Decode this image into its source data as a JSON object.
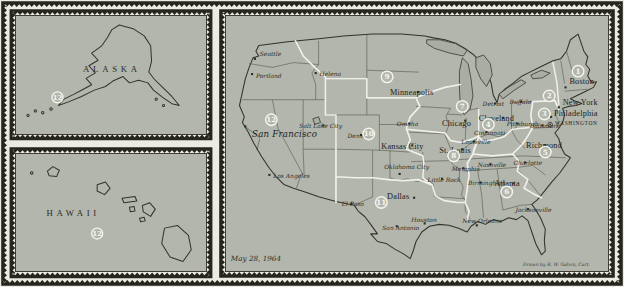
{
  "figure": {
    "date_label": "May 28, 1964",
    "credit": "Drawn by R. W. Galvin, Cart."
  },
  "colors": {
    "paper": "#ebebe3",
    "map_background": "#b2b6ac",
    "ink": "#2e2e27",
    "district_boundary": "#f4f4ee",
    "lake": "#a9ada3"
  },
  "insets": {
    "alaska": {
      "label": "ALASKA",
      "district": "12",
      "district_xy": [
        45,
        90
      ]
    },
    "hawaii": {
      "label": "HAWAII",
      "district": "12",
      "district_xy": [
        88,
        88
      ]
    }
  },
  "main_map": {
    "districts": [
      {
        "n": "1",
        "x": 365,
        "y": 58
      },
      {
        "n": "2",
        "x": 335,
        "y": 84
      },
      {
        "n": "3",
        "x": 330,
        "y": 103
      },
      {
        "n": "4",
        "x": 272,
        "y": 114
      },
      {
        "n": "5",
        "x": 331,
        "y": 143
      },
      {
        "n": "6",
        "x": 291,
        "y": 185
      },
      {
        "n": "7",
        "x": 245,
        "y": 95
      },
      {
        "n": "8",
        "x": 236,
        "y": 147
      },
      {
        "n": "9",
        "x": 167,
        "y": 64
      },
      {
        "n": "10",
        "x": 148,
        "y": 124
      },
      {
        "n": "11",
        "x": 161,
        "y": 196
      },
      {
        "n": "12",
        "x": 47,
        "y": 109
      }
    ],
    "cities": [
      {
        "name": "Seattle",
        "cls": "sm",
        "label": [
          35,
          42
        ],
        "dot": [
          30,
          45
        ]
      },
      {
        "name": "Portland",
        "cls": "sm",
        "label": [
          31,
          65
        ],
        "dot": [
          27,
          61
        ]
      },
      {
        "name": "Helena",
        "cls": "sm",
        "label": [
          97,
          63
        ],
        "dot": [
          93,
          60
        ]
      },
      {
        "name": "San Francisco",
        "cls": "bigit",
        "label": [
          27,
          127
        ],
        "dot": [
          20,
          116
        ]
      },
      {
        "name": "Los Angeles",
        "cls": "sm",
        "label": [
          49,
          170
        ],
        "dot": [
          45,
          167
        ]
      },
      {
        "name": "Salt Lake City",
        "cls": "sm",
        "label": [
          76,
          118
        ],
        "dot": [
          101,
          115
        ]
      },
      {
        "name": "Denver",
        "cls": "sm",
        "label": [
          126,
          128
        ],
        "dot": [
          140,
          125
        ]
      },
      {
        "name": "Omaha",
        "cls": "sm",
        "label": [
          177,
          116
        ],
        "dot": [
          190,
          113
        ]
      },
      {
        "name": "Kansas City",
        "cls": "big",
        "label": [
          161,
          140
        ],
        "dot": [
          193,
          136
        ]
      },
      {
        "name": "St. Louis",
        "cls": "big",
        "label": [
          221,
          144
        ],
        "dot": [
          245,
          140
        ]
      },
      {
        "name": "Oklahoma City",
        "cls": "sm",
        "label": [
          164,
          161
        ],
        "dot": [
          180,
          166
        ]
      },
      {
        "name": "Little Rock",
        "cls": "sm",
        "label": [
          209,
          174
        ],
        "dot": [
          224,
          171
        ]
      },
      {
        "name": "Memphis",
        "cls": "sm",
        "label": [
          234,
          163
        ],
        "dot": [
          246,
          160
        ]
      },
      {
        "name": "Dallas",
        "cls": "big",
        "label": [
          167,
          192
        ],
        "dot": [
          195,
          191
        ]
      },
      {
        "name": "El Paso",
        "cls": "sm",
        "label": [
          120,
          200
        ],
        "dot": [
          130,
          197
        ]
      },
      {
        "name": "San Antonio",
        "cls": "sm",
        "label": [
          162,
          225
        ],
        "dot": [
          177,
          221
        ]
      },
      {
        "name": "Houston",
        "cls": "sm",
        "label": [
          192,
          217
        ],
        "dot": [
          206,
          218
        ]
      },
      {
        "name": "New Orleans",
        "cls": "sm",
        "label": [
          245,
          218
        ],
        "dot": [
          260,
          220
        ]
      },
      {
        "name": "Birmingham",
        "cls": "sm",
        "label": [
          251,
          178
        ],
        "dot": [
          264,
          175
        ]
      },
      {
        "name": "Nashville",
        "cls": "sm",
        "label": [
          261,
          159
        ],
        "dot": [
          274,
          156
        ]
      },
      {
        "name": "Louisville",
        "cls": "sm",
        "label": [
          244,
          135
        ],
        "dot": [
          257,
          132
        ]
      },
      {
        "name": "Cincinnati",
        "cls": "sm",
        "label": [
          257,
          125
        ],
        "dot": [
          270,
          122
        ]
      },
      {
        "name": "Chicago",
        "cls": "big",
        "label": [
          224,
          116
        ],
        "dot": [
          248,
          110
        ]
      },
      {
        "name": "Detroit",
        "cls": "sm",
        "label": [
          266,
          95
        ],
        "dot": [
          279,
          92
        ]
      },
      {
        "name": "Cleveland",
        "cls": "big",
        "label": [
          262,
          110
        ],
        "dot": [
          287,
          107
        ]
      },
      {
        "name": "Buffalo",
        "cls": "sm",
        "label": [
          294,
          92
        ],
        "dot": [
          306,
          90
        ]
      },
      {
        "name": "Pittsburgh",
        "cls": "sm",
        "label": [
          291,
          116
        ],
        "dot": [
          302,
          113
        ]
      },
      {
        "name": "Minneapolis",
        "cls": "big",
        "label": [
          170,
          83
        ],
        "dot": [
          199,
          80
        ]
      },
      {
        "name": "Boston",
        "cls": "big",
        "label": [
          356,
          71
        ],
        "dot": [
          352,
          75
        ]
      },
      {
        "name": "New York",
        "cls": "big",
        "label": [
          349,
          94
        ],
        "dot": [
          345,
          96
        ]
      },
      {
        "name": "Philadelphia",
        "cls": "big",
        "label": [
          340,
          105
        ],
        "dot": [
          337,
          106
        ]
      },
      {
        "name": "WASHINGTON",
        "cls": "caps",
        "label": [
          341,
          115
        ],
        "dot": [
          336,
          114
        ],
        "marker": "seat"
      },
      {
        "name": "Baltimore",
        "cls": "sm",
        "label": [
          315,
          118
        ],
        "dot": [
          328,
          115
        ]
      },
      {
        "name": "Richmond",
        "cls": "big",
        "label": [
          311,
          139
        ],
        "dot": [
          331,
          136
        ]
      },
      {
        "name": "Charlotte",
        "cls": "sm",
        "label": [
          298,
          157
        ],
        "dot": [
          310,
          154
        ]
      },
      {
        "name": "Atlanta",
        "cls": "big",
        "label": [
          278,
          179
        ],
        "dot": [
          298,
          176
        ]
      },
      {
        "name": "Jacksonville",
        "cls": "sm",
        "label": [
          300,
          206
        ],
        "dot": [
          313,
          203
        ]
      }
    ]
  }
}
